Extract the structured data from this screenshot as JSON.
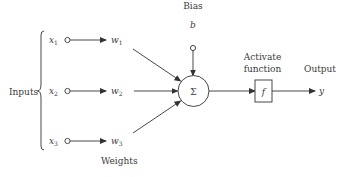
{
  "diagram": {
    "type": "perceptron",
    "labels": {
      "bias": "Bias",
      "bias_symbol": "b",
      "inputs": "Inputs",
      "weights": "Weights",
      "activate_line1": "Activate",
      "activate_line2": "function",
      "output": "Output",
      "output_symbol": "y",
      "sum_symbol": "Σ",
      "function_symbol": "f"
    },
    "inputs": [
      {
        "symbol": "x",
        "sub": "1",
        "weight_symbol": "w",
        "weight_sub": "1"
      },
      {
        "symbol": "x",
        "sub": "2",
        "weight_symbol": "w",
        "weight_sub": "2"
      },
      {
        "symbol": "x",
        "sub": "3",
        "weight_symbol": "w",
        "weight_sub": "3"
      }
    ],
    "colors": {
      "stroke": "#333333",
      "text": "#3a3a3a",
      "background": "#ffffff"
    }
  }
}
